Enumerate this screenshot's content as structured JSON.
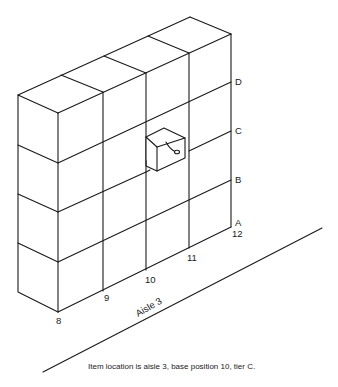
{
  "diagram": {
    "tiers": [
      "A",
      "B",
      "C",
      "D"
    ],
    "base_positions": [
      "8",
      "9",
      "10",
      "11",
      "12"
    ],
    "aisle_label": "Aisle 3",
    "caption": "Item location is aisle 3, base position 10, tier C.",
    "highlighted_item": {
      "aisle": "3",
      "base_position": "10",
      "tier": "C"
    },
    "line_color": "#1a1a1a",
    "background": "#ffffff"
  }
}
